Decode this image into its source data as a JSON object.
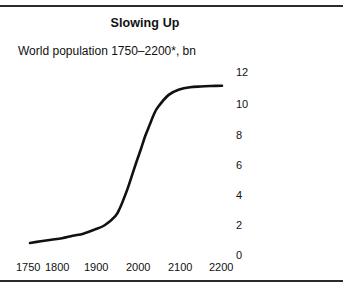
{
  "figure": {
    "title": "Slowing Up",
    "subtitle": "World population 1750–2200*, bn",
    "rule_color": "#2b2b2b",
    "background": "#ffffff",
    "curve_color": "#111111"
  },
  "chart_data": {
    "type": "line",
    "title": "Slowing Up",
    "subtitle": "World population 1750–2200*, bn",
    "xlabel": "",
    "ylabel": "bn",
    "xlim": [
      1750,
      2200
    ],
    "ylim": [
      0,
      12
    ],
    "grid": false,
    "legend": null,
    "axis_position": {
      "y_axis": "right",
      "x_axis": "bottom"
    },
    "xticks": [
      1750,
      1800,
      1900,
      2000,
      2100,
      2200
    ],
    "xticklabels": [
      "1750",
      "1800",
      "1900",
      "2000",
      "2100",
      "2200"
    ],
    "yticks": [
      0,
      2,
      4,
      6,
      8,
      10,
      12
    ],
    "yticklabels": [
      "0",
      "2",
      "4",
      "6",
      "8",
      "10",
      "12"
    ],
    "annotations": [
      "* Forecast indicated by asterisk in subtitle"
    ],
    "series": [
      {
        "name": "World population",
        "x": [
          1750,
          1775,
          1800,
          1825,
          1850,
          1875,
          1900,
          1925,
          1950,
          1960,
          1970,
          1980,
          1990,
          2000,
          2010,
          2020,
          2030,
          2040,
          2050,
          2075,
          2100,
          2125,
          2150,
          2175,
          2200
        ],
        "values": [
          0.79,
          0.9,
          1.0,
          1.1,
          1.26,
          1.4,
          1.65,
          1.95,
          2.55,
          3.03,
          3.7,
          4.45,
          5.3,
          6.15,
          6.95,
          7.8,
          8.5,
          9.2,
          9.7,
          10.5,
          10.85,
          11.0,
          11.05,
          11.08,
          11.1
        ]
      }
    ]
  },
  "ytick_layout": [
    {
      "label": "12",
      "top": 67
    },
    {
      "label": "10",
      "top": 99
    },
    {
      "label": "8",
      "top": 130
    },
    {
      "label": "6",
      "top": 160
    },
    {
      "label": "4",
      "top": 190
    },
    {
      "label": "2",
      "top": 220
    },
    {
      "label": "0",
      "top": 250
    }
  ],
  "xtick_layout": [
    {
      "label": "1750",
      "left": 16
    },
    {
      "label": "1800",
      "left": 45
    },
    {
      "label": "1900",
      "left": 84
    },
    {
      "label": "2000",
      "left": 126
    },
    {
      "label": "2100",
      "left": 168
    },
    {
      "label": "2200",
      "left": 209
    }
  ]
}
